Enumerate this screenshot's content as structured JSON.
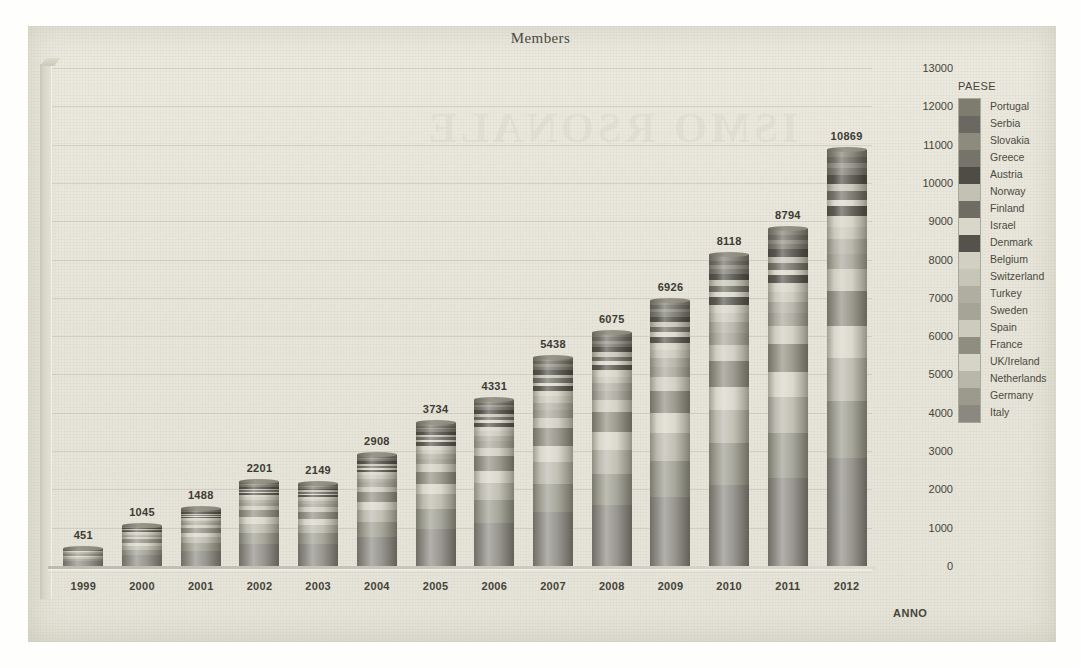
{
  "chart_data": {
    "type": "bar",
    "subtype": "stacked-bar-3d",
    "title": "Members",
    "xlabel": "ANNO",
    "ylabel": "",
    "ylim": [
      0,
      13000
    ],
    "ytick_step": 1000,
    "yticks": [
      "13000",
      "12000",
      "11000",
      "10000",
      "9000",
      "8000",
      "7000",
      "6000",
      "5000",
      "4000",
      "3000",
      "2000",
      "1000",
      "0"
    ],
    "grid": true,
    "legend_position": "right",
    "legend_title": "PAESE",
    "categories": [
      "1999",
      "2000",
      "2001",
      "2002",
      "2003",
      "2004",
      "2005",
      "2006",
      "2007",
      "2008",
      "2009",
      "2010",
      "2011",
      "2012"
    ],
    "values": [
      451,
      1045,
      1488,
      2201,
      2149,
      2908,
      3734,
      4331,
      5438,
      6075,
      6926,
      8118,
      8794,
      10869
    ],
    "data_labels": [
      "451",
      "1045",
      "1488",
      "2201",
      "2149",
      "2908",
      "3734",
      "4331",
      "5438",
      "6075",
      "6926",
      "8118",
      "8794",
      "10869"
    ],
    "series": [
      {
        "name": "Portugal",
        "color": "#7e7c6e",
        "share": 0.018
      },
      {
        "name": "Serbia",
        "color": "#6a6860",
        "share": 0.014
      },
      {
        "name": "Slovakia",
        "color": "#8d8b7e",
        "share": 0.012
      },
      {
        "name": "Greece",
        "color": "#75736a",
        "share": 0.016
      },
      {
        "name": "Austria",
        "color": "#4e4c45",
        "share": 0.022
      },
      {
        "name": "Norway",
        "color": "#c3c1b3",
        "share": 0.018
      },
      {
        "name": "Finland",
        "color": "#6f6d63",
        "share": 0.02
      },
      {
        "name": "Israel",
        "color": "#d9d7c9",
        "share": 0.016
      },
      {
        "name": "Denmark",
        "color": "#54524a",
        "share": 0.024
      },
      {
        "name": "Belgium",
        "color": "#d2d0c2",
        "share": 0.026
      },
      {
        "name": "Switzerland",
        "color": "#c7c5b7",
        "share": 0.03
      },
      {
        "name": "Turkey",
        "color": "#b0aea1",
        "share": 0.034
      },
      {
        "name": "Sweden",
        "color": "#a6a497",
        "share": 0.038
      },
      {
        "name": "Spain",
        "color": "#cdcbbd",
        "share": 0.052
      },
      {
        "name": "France",
        "color": "#8f8d80",
        "share": 0.085
      },
      {
        "name": "UK/Ireland",
        "color": "#d6d4c6",
        "share": 0.075
      },
      {
        "name": "Netherlands",
        "color": "#b9b7aa",
        "share": 0.105
      },
      {
        "name": "Germany",
        "color": "#9b9a8d",
        "share": 0.135
      },
      {
        "name": "Italy",
        "color": "#8a8880",
        "share": 0.26
      }
    ]
  },
  "ghost_text": "ISMO RSONALE",
  "colors": {
    "paper": "#e8e6da",
    "ink": "#45443b",
    "grid": "#a0a08e"
  }
}
